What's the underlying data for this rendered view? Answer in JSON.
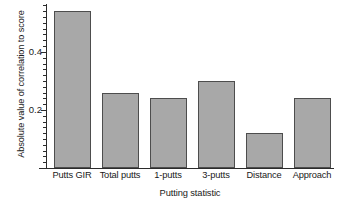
{
  "chart_data": {
    "type": "bar",
    "title": "",
    "subtitle": "",
    "xlabel": "Putting statistic",
    "ylabel": "Absolute value of correlation to score",
    "categories": [
      "Putts GIR",
      "Total putts",
      "1-putts",
      "3-putts",
      "Distance",
      "Approach"
    ],
    "values": [
      0.54,
      0.26,
      0.24,
      0.3,
      0.12,
      0.24
    ],
    "series": [
      {
        "name": "Absolute value of correlation to score",
        "values": [
          0.54,
          0.26,
          0.24,
          0.3,
          0.12,
          0.24
        ]
      }
    ],
    "ylim": [
      0,
      0.565
    ],
    "ytick_labels": [
      "0.2",
      "0.4"
    ],
    "ytick_values": [
      0.2,
      0.4
    ],
    "yminor_tick_step": 0.02,
    "grid": false,
    "legend": false,
    "legend_position": "none",
    "bar_fill_color": "#a8a8a8",
    "bar_edge_color": "#4d4d4d",
    "axis_color": "#2b2b2b",
    "background_color": "#ffffff",
    "annotations": []
  }
}
